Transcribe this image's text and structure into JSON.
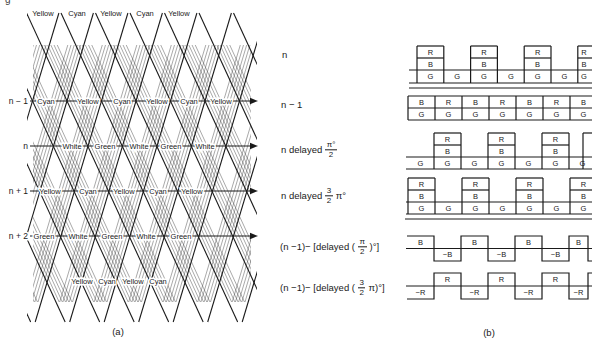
{
  "page": {
    "caption_a": "(a)",
    "caption_b": "(b)",
    "partial_char": "g",
    "ink": "#1a1a1a",
    "hatch_color": "#3f3f3f"
  },
  "signal_labels": [
    {
      "text": "n",
      "x": 282,
      "y": 54
    },
    {
      "text": "n − 1",
      "x": 281,
      "y": 104
    },
    {
      "pre": "n delayed",
      "num": "π°",
      "den": "2",
      "post": "",
      "x": 281,
      "y": 150
    },
    {
      "pre": "n delayed",
      "num": "3",
      "den": "2",
      "post": "π°",
      "x": 281,
      "y": 196
    },
    {
      "pre": "(n −1)− [delayed (",
      "num": "π",
      "den": "2",
      "post": ")°]",
      "x": 280,
      "y": 247
    },
    {
      "pre": "(n −1)− [delayed (",
      "num": "3",
      "den": "2",
      "post": "π)°]",
      "x": 280,
      "y": 288
    }
  ],
  "diagram_a": {
    "row_labels": [
      "n − 1",
      "n",
      "n + 1",
      "n + 2"
    ],
    "rows_y": [
      101,
      146,
      191,
      236
    ],
    "row_label_x": 28,
    "arrow": {
      "x1": 30,
      "x2": 250,
      "tip": 258
    },
    "label_rows": [
      {
        "y": 13,
        "items": [
          [
            "Yellow",
            43
          ],
          [
            "Cyan",
            77
          ],
          [
            "Yellow",
            111
          ],
          [
            "Cyan",
            145
          ],
          [
            "Yellow",
            179
          ]
        ]
      },
      {
        "y": 101,
        "items": [
          [
            "Cyan",
            46
          ],
          [
            "Yellow",
            88
          ],
          [
            "Cyan",
            122
          ],
          [
            "Yellow",
            157
          ],
          [
            "Cyan",
            189
          ],
          [
            "Yellow",
            221
          ]
        ]
      },
      {
        "y": 146,
        "items": [
          [
            "White",
            72
          ],
          [
            "Green",
            105
          ],
          [
            "White",
            139
          ],
          [
            "Green",
            171
          ],
          [
            "White",
            205
          ]
        ]
      },
      {
        "y": 191,
        "items": [
          [
            "Yellow",
            50
          ],
          [
            "Cyan",
            88
          ],
          [
            "Yellow",
            124
          ],
          [
            "Cyan",
            158
          ],
          [
            "Yellow",
            192
          ]
        ]
      },
      {
        "y": 236,
        "items": [
          [
            "Green",
            44
          ],
          [
            "White",
            78
          ],
          [
            "Green",
            112
          ],
          [
            "White",
            146
          ],
          [
            "Green",
            181
          ]
        ]
      },
      {
        "y": 281,
        "items": [
          [
            "Yellow",
            82
          ],
          [
            "Cyan",
            107
          ],
          [
            "Yellow",
            133
          ],
          [
            "Cyan",
            158
          ]
        ]
      }
    ],
    "lattice": {
      "cross_y": 101,
      "x0": 67,
      "period": 34.5,
      "slope_back": 0.46,
      "slope_fwd": -0.3,
      "y_top": 13,
      "y_bot": 322,
      "k_back": [
        -4,
        6
      ],
      "k_fwd": [
        -2,
        7
      ],
      "hatch_step": 3.2,
      "hatch_count": 5,
      "hatch_clip": [
        33,
        45,
        251,
        302
      ],
      "clip": [
        27,
        8,
        257,
        325
      ]
    },
    "caption_x": 118,
    "caption_y": 326
  },
  "diagram_b": {
    "rows": [
      {
        "kind": "towers",
        "x0": 417,
        "cw": 26.8,
        "yR": 46,
        "yB": 58,
        "yG": 70,
        "yBot": 83,
        "line_start": 409,
        "towers": [
          1,
          3,
          5,
          7
        ],
        "cells": 7,
        "tower_top": "R",
        "tower_mid": "B",
        "g_letter": "G",
        "baseline_y": 88,
        "baseline_x": 409
      },
      {
        "kind": "band",
        "x0": 408,
        "cw": 27,
        "yTop": 96,
        "yMid": 108,
        "yBot": 120,
        "top_letters": [
          "B",
          "R",
          "B",
          "R",
          "B",
          "R",
          "B"
        ],
        "bottom_letters": [
          "G",
          "G",
          "G",
          "G",
          "G",
          "G",
          "G"
        ]
      },
      {
        "kind": "towers",
        "x0": 407,
        "cw": 27,
        "yR": 133,
        "yB": 145,
        "yG": 157,
        "yBot": 169,
        "line_start": 406,
        "open_left": true,
        "towers": [
          2,
          4,
          6
        ],
        "cells": 7,
        "tower_top": "R",
        "tower_mid": "B",
        "g_letter": "G",
        "partial_right": {
          "x": 583,
          "stub_to": 592
        }
      },
      {
        "kind": "towers",
        "x0": 408,
        "cw": 27,
        "yR": 178,
        "yB": 190,
        "yG": 202,
        "yBot": 214,
        "line_start": 406,
        "towers": [
          1,
          3,
          5,
          7
        ],
        "cells": 7,
        "tower_top": "R",
        "tower_mid": "B",
        "g_letter": "G",
        "baseline_y": 219,
        "baseline_x": 405
      },
      {
        "kind": "square",
        "x0": 407,
        "cw": 27,
        "yHigh": 236,
        "yMid": 248.5,
        "yLow": 261,
        "start": "high",
        "end_trans": 588,
        "end_x": 592,
        "pos_label": "B",
        "neg_label": "−B"
      },
      {
        "kind": "square",
        "x0": 407,
        "cw": 27,
        "yHigh": 273,
        "yMid": 286,
        "yLow": 299,
        "start": "low",
        "end_trans": 588,
        "end_x": 592,
        "pos_label": "R",
        "neg_label": "−R"
      }
    ],
    "caption_x": 489,
    "caption_y": 327
  }
}
